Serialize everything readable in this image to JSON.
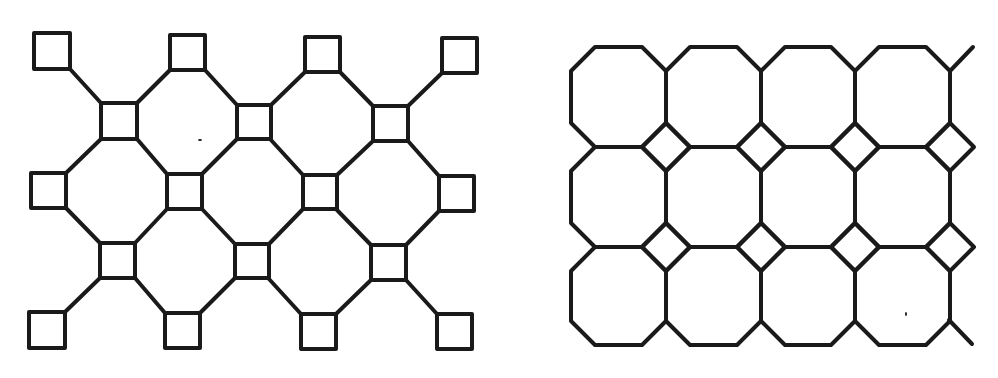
{
  "figure": {
    "stroke_color": "#1a1a1a",
    "background": "#ffffff",
    "panels": [
      {
        "name": "square-octagon-network",
        "description": "Squares on a diamond lattice joined by diagonal links, forming octagonal voids",
        "squares": [
          {
            "x": 34,
            "y": 33,
            "s": 36
          },
          {
            "x": 170,
            "y": 35,
            "s": 35
          },
          {
            "x": 305,
            "y": 37,
            "s": 35
          },
          {
            "x": 442,
            "y": 38,
            "s": 35
          },
          {
            "x": 101,
            "y": 103,
            "s": 36
          },
          {
            "x": 237,
            "y": 105,
            "s": 34
          },
          {
            "x": 373,
            "y": 106,
            "s": 35
          },
          {
            "x": 31,
            "y": 173,
            "s": 35
          },
          {
            "x": 167,
            "y": 174,
            "s": 35
          },
          {
            "x": 303,
            "y": 175,
            "s": 34
          },
          {
            "x": 439,
            "y": 176,
            "s": 35
          },
          {
            "x": 100,
            "y": 243,
            "s": 35
          },
          {
            "x": 235,
            "y": 244,
            "s": 34
          },
          {
            "x": 371,
            "y": 245,
            "s": 35
          },
          {
            "x": 29,
            "y": 312,
            "s": 36
          },
          {
            "x": 165,
            "y": 313,
            "s": 35
          },
          {
            "x": 301,
            "y": 314,
            "s": 35
          },
          {
            "x": 437,
            "y": 314,
            "s": 35
          }
        ],
        "links": [
          [
            70,
            69,
            101,
            103
          ],
          [
            170,
            70,
            137,
            103
          ],
          [
            205,
            70,
            237,
            105
          ],
          [
            305,
            72,
            271,
            105
          ],
          [
            340,
            72,
            373,
            106
          ],
          [
            442,
            73,
            408,
            106
          ],
          [
            101,
            139,
            66,
            173
          ],
          [
            137,
            139,
            167,
            174
          ],
          [
            237,
            139,
            202,
            174
          ],
          [
            271,
            140,
            303,
            175
          ],
          [
            373,
            141,
            337,
            175
          ],
          [
            408,
            141,
            439,
            176
          ],
          [
            66,
            208,
            100,
            243
          ],
          [
            167,
            209,
            135,
            243
          ],
          [
            202,
            209,
            235,
            244
          ],
          [
            303,
            209,
            269,
            244
          ],
          [
            337,
            210,
            371,
            245
          ],
          [
            439,
            211,
            406,
            245
          ],
          [
            100,
            278,
            65,
            312
          ],
          [
            135,
            278,
            165,
            313
          ],
          [
            235,
            278,
            200,
            313
          ],
          [
            269,
            279,
            301,
            314
          ],
          [
            371,
            280,
            336,
            314
          ],
          [
            406,
            280,
            437,
            314
          ]
        ],
        "specks": [
          [
            200,
            140
          ]
        ]
      },
      {
        "name": "octagon-square-tiling",
        "description": "Truncated square tiling: 4x3 octagons with small diamond squares at the interior junctions",
        "grid": {
          "col_x": [
            571,
            666,
            761,
            855,
            950
          ],
          "row_y": [
            47,
            147,
            247,
            345
          ],
          "cut": 24
        },
        "tails": [
          [
            950,
            71,
            973,
            47
          ],
          [
            949,
            320,
            972,
            344
          ]
        ],
        "specks": [
          [
            906,
            314
          ]
        ]
      }
    ]
  }
}
